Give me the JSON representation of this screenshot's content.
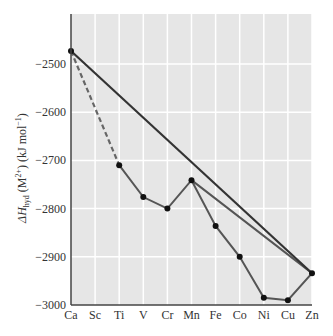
{
  "chart_data": {
    "type": "line",
    "title": "",
    "xlabel": "",
    "ylabel": "ΔH_hyd (M²⁺) (kJ mol⁻¹)",
    "ylabel_parts": {
      "symbol": "ΔH",
      "sub": "hyd",
      "rest": " (M",
      "sup": "2+",
      "rest2": ") (kJ mol",
      "sup2": "−1",
      "rest3": ")"
    },
    "categories": [
      "Ca",
      "Sc",
      "Ti",
      "V",
      "Cr",
      "Mn",
      "Fe",
      "Co",
      "Ni",
      "Cu",
      "Zn"
    ],
    "ylim": [
      -3000,
      -2400
    ],
    "yticks": [
      -2500,
      -2600,
      -2700,
      -2800,
      -2900,
      -3000
    ],
    "ytick_labels": [
      "−2500",
      "−2600",
      "−2700",
      "−2800",
      "−2900",
      "−3000"
    ],
    "grid": true,
    "series": [
      {
        "name": "Measured hydration enthalpy",
        "style": "solid-with-markers",
        "color": "#555555",
        "points": [
          {
            "x": "Ti",
            "y": -2710
          },
          {
            "x": "V",
            "y": -2776
          },
          {
            "x": "Cr",
            "y": -2800
          },
          {
            "x": "Mn",
            "y": -2741
          },
          {
            "x": "Fe",
            "y": -2836
          },
          {
            "x": "Co",
            "y": -2900
          },
          {
            "x": "Ni",
            "y": -2985
          },
          {
            "x": "Cu",
            "y": -2990
          },
          {
            "x": "Zn",
            "y": -2934
          },
          {
            "x": "Mn",
            "y": -2741
          }
        ]
      },
      {
        "name": "Ca to Ti (extrapolated)",
        "style": "dashed",
        "color": "#666666",
        "points": [
          {
            "x": "Ca",
            "y": -2473
          },
          {
            "x": "Ti",
            "y": -2710
          }
        ]
      },
      {
        "name": "Trend line Ca–Mn–Zn",
        "style": "solid-thick",
        "color": "#333333",
        "points": [
          {
            "x": "Ca",
            "y": -2473
          },
          {
            "x": "Zn",
            "y": -2934
          }
        ]
      }
    ],
    "markers": [
      {
        "x": "Ca",
        "y": -2473
      },
      {
        "x": "Ti",
        "y": -2710
      },
      {
        "x": "V",
        "y": -2776
      },
      {
        "x": "Cr",
        "y": -2800
      },
      {
        "x": "Mn",
        "y": -2741
      },
      {
        "x": "Fe",
        "y": -2836
      },
      {
        "x": "Co",
        "y": -2900
      },
      {
        "x": "Ni",
        "y": -2985
      },
      {
        "x": "Cu",
        "y": -2990
      },
      {
        "x": "Zn",
        "y": -2934
      }
    ]
  },
  "colors": {
    "plot_background": "#e6e6e6",
    "gridline": "#ffffff",
    "axis": "#444444",
    "marker": "#111111"
  }
}
